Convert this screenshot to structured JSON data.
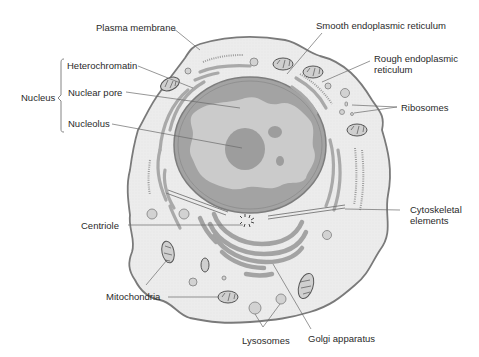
{
  "diagram": {
    "colors": {
      "cytoplasm": "#ececec",
      "outline": "#7a7a7a",
      "organelle": "#a9a9a9",
      "nucleoplasm": "#c9c9c9",
      "chromatin": "#999999",
      "leader": "#6a6a6a",
      "text": "#2a2a2a"
    },
    "labels": {
      "plasma_membrane": "Plasma membrane",
      "smooth_er": "Smooth endoplasmic reticulum",
      "rough_er_line1": "Rough endoplasmic",
      "rough_er_line2": "reticulum",
      "ribosomes": "Ribosomes",
      "nucleus": "Nucleus",
      "heterochromatin": "Heterochromatin",
      "nuclear_pore": "Nuclear pore",
      "nucleolus": "Nucleolus",
      "cytoskeletal_line1": "Cytoskeletal",
      "cytoskeletal_line2": "elements",
      "centriole": "Centriole",
      "mitochondria": "Mitochondria",
      "lysosomes": "Lysosomes",
      "golgi": "Golgi apparatus"
    }
  }
}
